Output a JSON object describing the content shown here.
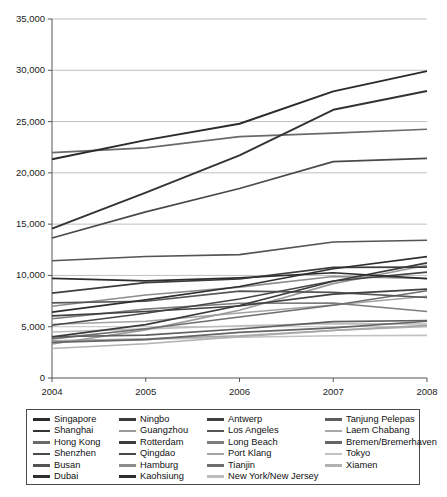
{
  "chart_data": {
    "type": "line",
    "title": "",
    "subtitle": "",
    "xlabel": "",
    "ylabel": "",
    "x": [
      2004,
      2005,
      2006,
      2007,
      2008
    ],
    "xtick_labels": [
      "2004",
      "2005",
      "2006",
      "2007",
      "2008"
    ],
    "ytick_labels": [
      "0",
      "5,000",
      "10,000",
      "15,000",
      "20,000",
      "25,000",
      "30,000",
      "35,000"
    ],
    "ytick_values": [
      0,
      5000,
      10000,
      15000,
      20000,
      25000,
      30000,
      35000
    ],
    "ylim": [
      0,
      35000
    ],
    "xlim": [
      2004,
      2008
    ],
    "grid": true,
    "grid_axis": "y",
    "legend_position": "bottom",
    "legend_columns": 4,
    "units": "thousand TEU",
    "series": [
      {
        "name": "Singapore",
        "color": "#2b2b2b",
        "width": 1.9,
        "values": [
          21330,
          23190,
          24790,
          27940,
          29920
        ]
      },
      {
        "name": "Shanghai",
        "color": "#333333",
        "width": 1.9,
        "values": [
          14560,
          18080,
          21710,
          26150,
          27980
        ]
      },
      {
        "name": "Hong Kong",
        "color": "#6a6a6a",
        "width": 1.7,
        "values": [
          21980,
          22430,
          23540,
          23880,
          24250
        ]
      },
      {
        "name": "Shenzhen",
        "color": "#4a4a4a",
        "width": 1.7,
        "values": [
          13650,
          16200,
          18470,
          21100,
          21410
        ]
      },
      {
        "name": "Busan",
        "color": "#545454",
        "width": 1.6,
        "values": [
          11430,
          11840,
          12030,
          13260,
          13430
        ]
      },
      {
        "name": "Dubai",
        "color": "#2f2f2f",
        "width": 1.7,
        "values": [
          6430,
          7620,
          8920,
          10650,
          11830
        ]
      },
      {
        "name": "Ningbo",
        "color": "#3a3a3a",
        "width": 1.7,
        "values": [
          4010,
          5210,
          7070,
          9430,
          11230
        ]
      },
      {
        "name": "Guangzhou",
        "color": "#9a9a9a",
        "width": 1.6,
        "values": [
          3310,
          4690,
          6600,
          9200,
          11000
        ]
      },
      {
        "name": "Rotterdam",
        "color": "#3d3d3d",
        "width": 1.7,
        "values": [
          8280,
          9290,
          9650,
          10790,
          10800
        ]
      },
      {
        "name": "Qingdao",
        "color": "#474747",
        "width": 1.6,
        "values": [
          5140,
          6310,
          7700,
          9460,
          10320
        ]
      },
      {
        "name": "Hamburg",
        "color": "#8c8c8c",
        "width": 1.6,
        "values": [
          7000,
          8090,
          8860,
          9890,
          9700
        ]
      },
      {
        "name": "Kaohsiung",
        "color": "#2e2e2e",
        "width": 1.7,
        "values": [
          9710,
          9470,
          9770,
          10260,
          9680
        ]
      },
      {
        "name": "Antwerp",
        "color": "#404040",
        "width": 1.6,
        "values": [
          6060,
          6490,
          7020,
          8180,
          8660
        ]
      },
      {
        "name": "Los Angeles",
        "color": "#565656",
        "width": 1.6,
        "values": [
          7320,
          7480,
          8470,
          8350,
          7850
        ]
      },
      {
        "name": "Long Beach",
        "color": "#7d7d7d",
        "width": 1.6,
        "values": [
          5780,
          6710,
          7290,
          7310,
          6490
        ]
      },
      {
        "name": "Port Klang",
        "color": "#a3a3a3",
        "width": 1.6,
        "values": [
          5240,
          5540,
          6330,
          7120,
          7970
        ]
      },
      {
        "name": "Tianjin",
        "color": "#6e6e6e",
        "width": 1.6,
        "values": [
          3810,
          4800,
          5950,
          7100,
          8500
        ]
      },
      {
        "name": "New York/New Jersey",
        "color": "#bdbdbd",
        "width": 1.6,
        "values": [
          4480,
          4790,
          5090,
          5300,
          5270
        ]
      },
      {
        "name": "Tanjung Pelepas",
        "color": "#5e5e5e",
        "width": 1.6,
        "values": [
          4020,
          4180,
          4770,
          5500,
          5600
        ]
      },
      {
        "name": "Laem Chabang",
        "color": "#a8a8a8",
        "width": 1.6,
        "values": [
          3620,
          3830,
          4120,
          4640,
          5130
        ]
      },
      {
        "name": "Bremen/Bremerhaven",
        "color": "#656565",
        "width": 1.6,
        "values": [
          3470,
          3740,
          4450,
          4890,
          5530
        ]
      },
      {
        "name": "Tokyo",
        "color": "#c2c2c2",
        "width": 1.6,
        "values": [
          3580,
          3760,
          3970,
          4120,
          4160
        ]
      },
      {
        "name": "Xiamen",
        "color": "#b2b2b2",
        "width": 1.6,
        "values": [
          2870,
          3340,
          4020,
          4630,
          5030
        ]
      }
    ]
  },
  "axes": {
    "frame_color": "#555555",
    "grid_color": "#b9b9b9",
    "tick_color": "#555555"
  },
  "legend": {
    "border_color": "#4a4a4a",
    "columns": [
      [
        "Singapore",
        "Shanghai",
        "Hong Kong",
        "Shenzhen",
        "Busan",
        "Dubai"
      ],
      [
        "Ningbo",
        "Guangzhou",
        "Rotterdam",
        "Qingdao",
        "Hamburg",
        "Kaohsiung"
      ],
      [
        "Antwerp",
        "Los Angeles",
        "Long Beach",
        "Port Klang",
        "Tianjin",
        "New York/New Jersey"
      ],
      [
        "Tanjung Pelepas",
        "Laem Chabang",
        "Bremen/Bremerhaven",
        "Tokyo",
        "Xiamen"
      ]
    ]
  }
}
